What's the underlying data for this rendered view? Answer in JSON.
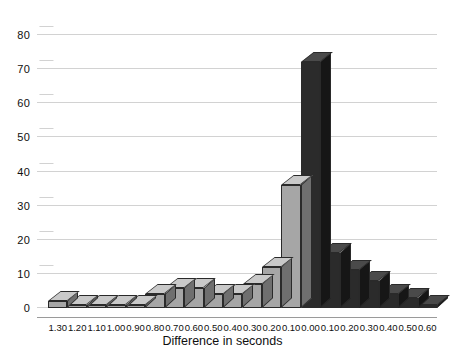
{
  "chart_data": {
    "type": "bar",
    "title": "",
    "xlabel": "Difference in seconds",
    "ylabel": "",
    "categories": [
      "1.30",
      "1.20",
      "1.10",
      "1.00",
      "0.90",
      "0.80",
      "0.70",
      "0.60",
      "0.50",
      "0.40",
      "0.30",
      "0.20",
      "0.10",
      "0.00",
      "0.10",
      "0.20",
      "0.30",
      "0.40",
      "0.50",
      "0.60"
    ],
    "values": [
      2,
      1,
      1,
      1,
      1,
      4,
      6,
      6,
      4,
      4,
      7,
      12,
      36,
      72,
      16,
      11,
      8,
      4,
      3,
      1
    ],
    "bar_styles": [
      "light",
      "light",
      "light",
      "light",
      "light",
      "light",
      "light",
      "light",
      "light",
      "light",
      "light",
      "light",
      "light",
      "dark",
      "dark",
      "dark",
      "dark",
      "dark",
      "dark",
      "dark"
    ],
    "ylim": [
      0,
      85
    ],
    "yticks": [
      0,
      10,
      20,
      30,
      40,
      50,
      60,
      70,
      80
    ],
    "grid": true,
    "legend": "none",
    "colors": {
      "light_face": "#a6a6a6",
      "light_top": "#c9c9c9",
      "light_side": "#6f6f6f",
      "dark_face": "#2b2b2b",
      "dark_top": "#4a4a4a",
      "dark_side": "#161616",
      "gridline": "#d2d2d2",
      "text": "#0f0f0f"
    }
  }
}
